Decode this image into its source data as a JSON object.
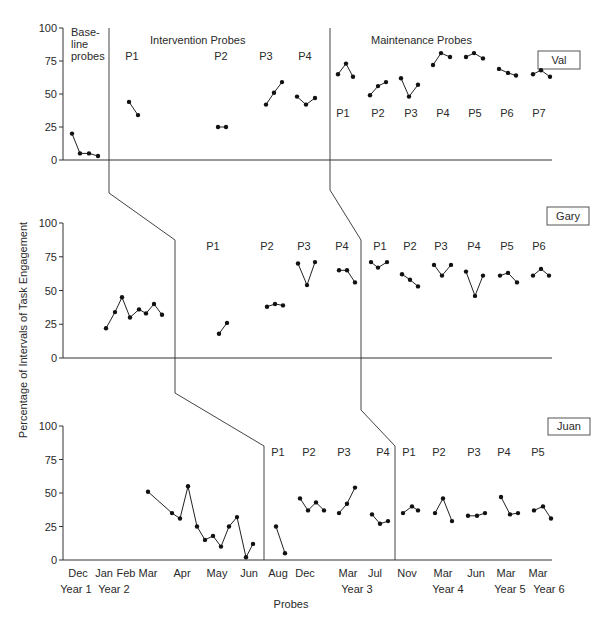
{
  "chart_data": {
    "type": "line",
    "title": "",
    "ylabel": "Percentage of Intervals of Task Engagement",
    "xlabel": "Probes",
    "ylim": [
      0,
      100
    ],
    "yticks": [
      0,
      25,
      50,
      75,
      100
    ],
    "grid": false,
    "layout": "multiple-baseline across 3 participants (stacked panels)",
    "phase_labels": {
      "baseline": "Base-\nline\nprobes",
      "intervention": "Intervention Probes",
      "maintenance": "Maintenance Probes"
    },
    "x_month_labels": [
      {
        "label": "Dec",
        "x": 78
      },
      {
        "label": "Jan",
        "x": 104
      },
      {
        "label": "Feb",
        "x": 126
      },
      {
        "label": "Mar",
        "x": 148
      },
      {
        "label": "Apr",
        "x": 182
      },
      {
        "label": "May",
        "x": 217
      },
      {
        "label": "Jun",
        "x": 249
      },
      {
        "label": "Aug",
        "x": 278
      },
      {
        "label": "Dec",
        "x": 305
      },
      {
        "label": "Mar",
        "x": 348
      },
      {
        "label": "Jul",
        "x": 375
      },
      {
        "label": "Nov",
        "x": 407
      },
      {
        "label": "Mar",
        "x": 443
      },
      {
        "label": "Jun",
        "x": 476
      },
      {
        "label": "Mar",
        "x": 506
      },
      {
        "label": "Mar",
        "x": 538
      }
    ],
    "x_year_labels": [
      {
        "label": "Year 1",
        "x": 76
      },
      {
        "label": "Year 2",
        "x": 114
      },
      {
        "label": "Year 3",
        "x": 357
      },
      {
        "label": "Year 4",
        "x": 448
      },
      {
        "label": "Year 5",
        "x": 510
      },
      {
        "label": "Year 6",
        "x": 549
      }
    ],
    "panels": [
      {
        "participant": "Val",
        "y0": 160,
        "y100": 28,
        "name_box": {
          "x": 538,
          "y": 51,
          "w": 42,
          "h": 18
        },
        "probe_labels_intervention": [
          {
            "label": "P1",
            "x": 132,
            "y": 60
          },
          {
            "label": "P2",
            "x": 221,
            "y": 60
          },
          {
            "label": "P3",
            "x": 266,
            "y": 60
          },
          {
            "label": "P4",
            "x": 305,
            "y": 60
          }
        ],
        "probe_labels_maintenance": [
          {
            "label": "P1",
            "x": 343,
            "y": 117
          },
          {
            "label": "P2",
            "x": 378,
            "y": 117
          },
          {
            "label": "P3",
            "x": 411,
            "y": 117
          },
          {
            "label": "P4",
            "x": 443,
            "y": 117
          },
          {
            "label": "P5",
            "x": 475,
            "y": 117
          },
          {
            "label": "P6",
            "x": 507,
            "y": 117
          },
          {
            "label": "P7",
            "x": 539,
            "y": 117
          }
        ],
        "series": [
          {
            "name": "Baseline",
            "points": [
              [
                72,
                20
              ],
              [
                80,
                5
              ],
              [
                89,
                5
              ],
              [
                98,
                3
              ]
            ]
          },
          {
            "name": "Intervention P1",
            "points": [
              [
                129,
                44
              ],
              [
                138,
                34
              ]
            ]
          },
          {
            "name": "Intervention P2",
            "points": [
              [
                218,
                25
              ],
              [
                226,
                25
              ]
            ]
          },
          {
            "name": "Intervention P3",
            "points": [
              [
                266,
                42
              ],
              [
                274,
                51
              ],
              [
                282,
                59
              ]
            ]
          },
          {
            "name": "Intervention P4",
            "points": [
              [
                297,
                48
              ],
              [
                306,
                42
              ],
              [
                315,
                47
              ]
            ]
          },
          {
            "name": "Maintenance P1",
            "points": [
              [
                338,
                65
              ],
              [
                346,
                73
              ],
              [
                353,
                63
              ]
            ]
          },
          {
            "name": "Maintenance P2",
            "points": [
              [
                370,
                49
              ],
              [
                378,
                56
              ],
              [
                386,
                59
              ]
            ]
          },
          {
            "name": "Maintenance P3",
            "points": [
              [
                401,
                62
              ],
              [
                409,
                48
              ],
              [
                418,
                57
              ]
            ]
          },
          {
            "name": "Maintenance P4",
            "points": [
              [
                433,
                72
              ],
              [
                441,
                81
              ],
              [
                450,
                78
              ]
            ]
          },
          {
            "name": "Maintenance P5",
            "points": [
              [
                466,
                78
              ],
              [
                474,
                81
              ],
              [
                483,
                77
              ]
            ]
          },
          {
            "name": "Maintenance P6",
            "points": [
              [
                499,
                69
              ],
              [
                508,
                66
              ],
              [
                516,
                64
              ]
            ]
          },
          {
            "name": "Maintenance P7",
            "points": [
              [
                533,
                65
              ],
              [
                541,
                68
              ],
              [
                550,
                63
              ]
            ]
          }
        ]
      },
      {
        "participant": "Gary",
        "y0": 358,
        "y100": 223,
        "name_box": {
          "x": 547,
          "y": 207,
          "w": 42,
          "h": 18
        },
        "probe_labels_intervention": [
          {
            "label": "P1",
            "x": 213,
            "y": 250
          },
          {
            "label": "P2",
            "x": 267,
            "y": 250
          },
          {
            "label": "P3",
            "x": 304,
            "y": 250
          },
          {
            "label": "P4",
            "x": 342,
            "y": 250
          }
        ],
        "probe_labels_maintenance": [
          {
            "label": "P1",
            "x": 380,
            "y": 250
          },
          {
            "label": "P2",
            "x": 410,
            "y": 250
          },
          {
            "label": "P3",
            "x": 441,
            "y": 250
          },
          {
            "label": "P4",
            "x": 474,
            "y": 250
          },
          {
            "label": "P5",
            "x": 507,
            "y": 250
          },
          {
            "label": "P6",
            "x": 539,
            "y": 250
          }
        ],
        "series": [
          {
            "name": "Baseline",
            "points": [
              [
                106,
                22
              ],
              [
                115,
                34
              ],
              [
                122,
                45
              ],
              [
                130,
                30
              ],
              [
                139,
                36
              ],
              [
                146,
                33
              ],
              [
                154,
                40
              ],
              [
                162,
                32
              ]
            ]
          },
          {
            "name": "Intervention P1",
            "points": [
              [
                219,
                18
              ],
              [
                227,
                26
              ]
            ]
          },
          {
            "name": "Intervention P2",
            "points": [
              [
                267,
                38
              ],
              [
                275,
                40
              ],
              [
                283,
                39
              ]
            ]
          },
          {
            "name": "Intervention P3",
            "points": [
              [
                298,
                70
              ],
              [
                307,
                54
              ],
              [
                315,
                71
              ]
            ]
          },
          {
            "name": "Intervention P4",
            "points": [
              [
                339,
                65
              ],
              [
                347,
                65
              ],
              [
                355,
                56
              ]
            ]
          },
          {
            "name": "Maintenance P1",
            "points": [
              [
                371,
                71
              ],
              [
                378,
                67
              ],
              [
                387,
                71
              ]
            ]
          },
          {
            "name": "Maintenance P2",
            "points": [
              [
                402,
                62
              ],
              [
                410,
                58
              ],
              [
                418,
                53
              ]
            ]
          },
          {
            "name": "Maintenance P3",
            "points": [
              [
                434,
                69
              ],
              [
                442,
                61
              ],
              [
                451,
                69
              ]
            ]
          },
          {
            "name": "Maintenance P4",
            "points": [
              [
                466,
                64
              ],
              [
                475,
                46
              ],
              [
                483,
                61
              ]
            ]
          },
          {
            "name": "Maintenance P5",
            "points": [
              [
                500,
                61
              ],
              [
                508,
                63
              ],
              [
                517,
                56
              ]
            ]
          },
          {
            "name": "Maintenance P6",
            "points": [
              [
                533,
                61
              ],
              [
                541,
                66
              ],
              [
                549,
                61
              ]
            ]
          }
        ]
      },
      {
        "participant": "Juan",
        "y0": 560,
        "y100": 426,
        "name_box": {
          "x": 548,
          "y": 418,
          "w": 42,
          "h": 17
        },
        "probe_labels_intervention": [
          {
            "label": "P1",
            "x": 278,
            "y": 456
          },
          {
            "label": "P2",
            "x": 309,
            "y": 456
          },
          {
            "label": "P3",
            "x": 344,
            "y": 456
          },
          {
            "label": "P4",
            "x": 383,
            "y": 456
          }
        ],
        "probe_labels_maintenance": [
          {
            "label": "P1",
            "x": 409,
            "y": 456
          },
          {
            "label": "P2",
            "x": 439,
            "y": 456
          },
          {
            "label": "P3",
            "x": 474,
            "y": 456
          },
          {
            "label": "P4",
            "x": 504,
            "y": 456
          },
          {
            "label": "P5",
            "x": 538,
            "y": 456
          }
        ],
        "series": [
          {
            "name": "Baseline",
            "points": [
              [
                148,
                51
              ],
              [
                172,
                35
              ],
              [
                180,
                31
              ],
              [
                188,
                55
              ],
              [
                197,
                25
              ],
              [
                205,
                15
              ],
              [
                213,
                18
              ],
              [
                221,
                10
              ],
              [
                229,
                25
              ],
              [
                237,
                32
              ],
              [
                246,
                2
              ],
              [
                253,
                12
              ]
            ]
          },
          {
            "name": "Intervention P1",
            "points": [
              [
                276,
                25
              ],
              [
                285,
                5
              ]
            ]
          },
          {
            "name": "Intervention P2",
            "points": [
              [
                300,
                46
              ],
              [
                308,
                37
              ],
              [
                316,
                43
              ],
              [
                324,
                37
              ]
            ]
          },
          {
            "name": "Intervention P3",
            "points": [
              [
                339,
                35
              ],
              [
                347,
                42
              ],
              [
                355,
                54
              ]
            ]
          },
          {
            "name": "Intervention P4",
            "points": [
              [
                372,
                34
              ],
              [
                380,
                27
              ],
              [
                388,
                29
              ]
            ]
          },
          {
            "name": "Maintenance P1",
            "points": [
              [
                403,
                35
              ],
              [
                412,
                40
              ],
              [
                418,
                37
              ]
            ]
          },
          {
            "name": "Maintenance P2",
            "points": [
              [
                435,
                35
              ],
              [
                443,
                46
              ],
              [
                452,
                29
              ]
            ]
          },
          {
            "name": "Maintenance P3",
            "points": [
              [
                468,
                33
              ],
              [
                477,
                33
              ],
              [
                485,
                35
              ]
            ]
          },
          {
            "name": "Maintenance P4",
            "points": [
              [
                501,
                47
              ],
              [
                510,
                34
              ],
              [
                518,
                35
              ]
            ]
          },
          {
            "name": "Maintenance P5",
            "points": [
              [
                534,
                37
              ],
              [
                543,
                40
              ],
              [
                551,
                31
              ]
            ]
          }
        ]
      }
    ]
  }
}
